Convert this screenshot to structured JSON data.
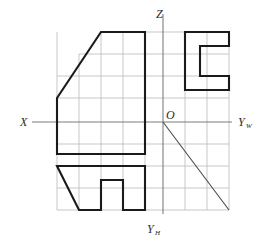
{
  "figure": {
    "type": "engineering-drawing",
    "background": "#ffffff",
    "grid_color": "#b9b9b9",
    "axis_color": "#7d7d7d",
    "outline_color": "#1a1a1a"
  },
  "axes": {
    "origin": {
      "label": "O",
      "x": 163,
      "y": 122
    },
    "x_axis": {
      "label": "X",
      "label_x": 20,
      "label_y": 126,
      "from_x": 32,
      "to_x": 232,
      "y": 122
    },
    "z_axis": {
      "label": "Z",
      "label_x": 156,
      "label_y": 18,
      "from_y": 14,
      "to_y": 214,
      "x": 163
    },
    "yw_axis": {
      "label": "Y",
      "subscript": "W",
      "label_x": 238,
      "label_y": 126
    },
    "yh_axis": {
      "label": "Y",
      "subscript": "H",
      "label_x": 147,
      "label_y": 233
    }
  },
  "grid": {
    "spacing": 22,
    "x_lines": [
      57,
      79,
      101,
      123,
      145,
      163,
      185,
      207,
      229
    ],
    "y_lines": [
      32,
      54,
      76,
      98,
      122,
      144,
      166,
      188,
      210
    ]
  },
  "views": {
    "front_view": {
      "name": "front-view",
      "description": "Trapezoid with sloped top-left edge",
      "points": "57,98 57,154 145,154 145,32 101,32"
    },
    "side_view": {
      "name": "side-view",
      "description": "C-shaped channel opening to the right",
      "points": "185,32 229,32 229,46 200,46 200,76 229,76 229,90 185,90"
    },
    "top_view": {
      "name": "top-view",
      "description": "Inverted U shape with central notch",
      "points": "57,166 145,166 145,210 123,210 123,180 101,180 101,210 79,210"
    }
  },
  "miter_line": {
    "name": "forty-five-degree-miter-line",
    "from_x": 163,
    "from_y": 122,
    "to_x": 229,
    "to_y": 210,
    "angle_degrees": 45
  }
}
